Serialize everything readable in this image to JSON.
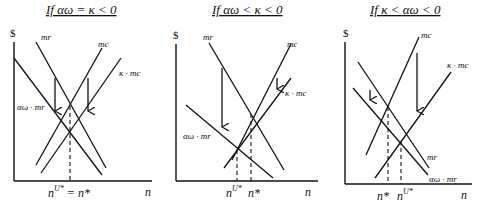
{
  "panels": [
    {
      "title": "If αω = κ < 0",
      "y_axis_label": "$",
      "x_axis_label": "n",
      "curves": {
        "mr": "mr",
        "mc": "mc",
        "kmc": "κ · mc",
        "awmr": "αω · mr"
      },
      "x_marks": [
        "n",
        "U*",
        " = n*"
      ]
    },
    {
      "title": "If αω < κ < 0",
      "y_axis_label": "$",
      "x_axis_label": "n",
      "curves": {
        "mr": "mr",
        "mc": "mc",
        "kmc": "κ · mc",
        "awmr": "αω · mr"
      },
      "x_marks": [
        "n",
        "U*",
        "n*"
      ]
    },
    {
      "title": "If κ < αω < 0",
      "y_axis_label": "$",
      "x_axis_label": "n",
      "curves": {
        "mr": "mr",
        "mc": "mc",
        "kmc": "κ · mc",
        "awmr": "αω · mr"
      },
      "x_marks": [
        "n*",
        "n",
        "U*"
      ]
    }
  ]
}
